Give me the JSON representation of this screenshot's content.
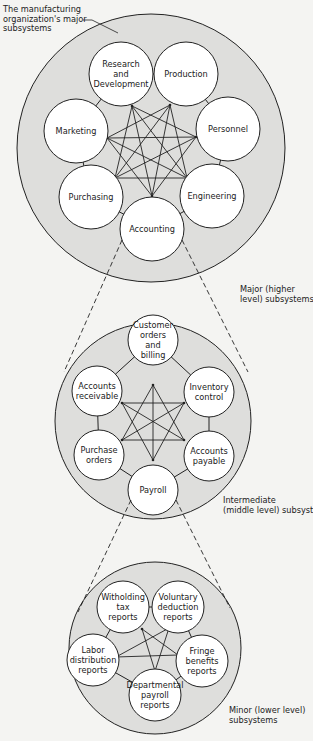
{
  "title_annotation": [
    "The manufacturing",
    "organization's major",
    "subsystems"
  ],
  "colors": {
    "background": "#f4f4f2",
    "system_fill": "#dededc",
    "subsystem_fill": "#ffffff",
    "line": "#222222"
  },
  "levels": [
    {
      "id": "major",
      "caption": [
        "Major (higher",
        "level) subsystems"
      ],
      "subsystems": [
        {
          "id": "rnd",
          "label": [
            "Research",
            "and",
            "Development"
          ]
        },
        {
          "id": "production",
          "label": [
            "Production"
          ]
        },
        {
          "id": "personnel",
          "label": [
            "Personnel"
          ]
        },
        {
          "id": "engineering",
          "label": [
            "Engineering"
          ]
        },
        {
          "id": "accounting",
          "label": [
            "Accounting"
          ]
        },
        {
          "id": "purchasing",
          "label": [
            "Purchasing"
          ]
        },
        {
          "id": "marketing",
          "label": [
            "Marketing"
          ]
        }
      ],
      "interconnections": "all-pairs",
      "expanded_subsystem": "accounting"
    },
    {
      "id": "intermediate",
      "caption": [
        "Intermediate",
        "(middle level) subsystems"
      ],
      "subsystems": [
        {
          "id": "customer",
          "label": [
            "Customer",
            "orders",
            "and",
            "billing"
          ]
        },
        {
          "id": "inventory",
          "label": [
            "Inventory",
            "control"
          ]
        },
        {
          "id": "payable",
          "label": [
            "Accounts",
            "payable"
          ]
        },
        {
          "id": "payroll",
          "label": [
            "Payroll"
          ]
        },
        {
          "id": "purchase",
          "label": [
            "Purchase",
            "orders"
          ]
        },
        {
          "id": "receivable",
          "label": [
            "Accounts",
            "receivable"
          ]
        }
      ],
      "interconnections": "all-non-adjacent-pairs",
      "expanded_subsystem": "payroll"
    },
    {
      "id": "minor",
      "caption": [
        "Minor (lower level)",
        "subsystems"
      ],
      "subsystems": [
        {
          "id": "withholding",
          "label": [
            "Witholding",
            "tax",
            "reports"
          ]
        },
        {
          "id": "voluntary",
          "label": [
            "Voluntary",
            "deduction",
            "reports"
          ]
        },
        {
          "id": "fringe",
          "label": [
            "Fringe",
            "benefits",
            "reports"
          ]
        },
        {
          "id": "departmental",
          "label": [
            "Departmental",
            "payroll",
            "reports"
          ]
        },
        {
          "id": "labor",
          "label": [
            "Labor",
            "distribution",
            "reports"
          ]
        }
      ],
      "interconnections": "pentagram"
    }
  ]
}
